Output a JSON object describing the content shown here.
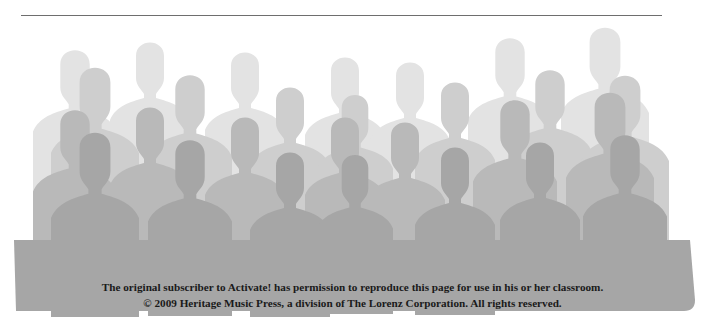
{
  "page": {
    "colors": {
      "background": "#ffffff",
      "rule": "#6e6e6e",
      "silhouette_back": "#dcdcdc",
      "silhouette_mid": "#c4c4c4",
      "silhouette_front": "#a7a7a7",
      "text": "#1a1a1a"
    }
  },
  "illustration": {
    "description": "Crowd of grey human silhouettes in overlapping rows"
  },
  "footer": {
    "line1": "The original subscriber to Activate! has permission to reproduce this page for use in his or her classroom.",
    "line2": "© 2009 Heritage Music Press, a division of The Lorenz Corporation. All rights reserved."
  }
}
